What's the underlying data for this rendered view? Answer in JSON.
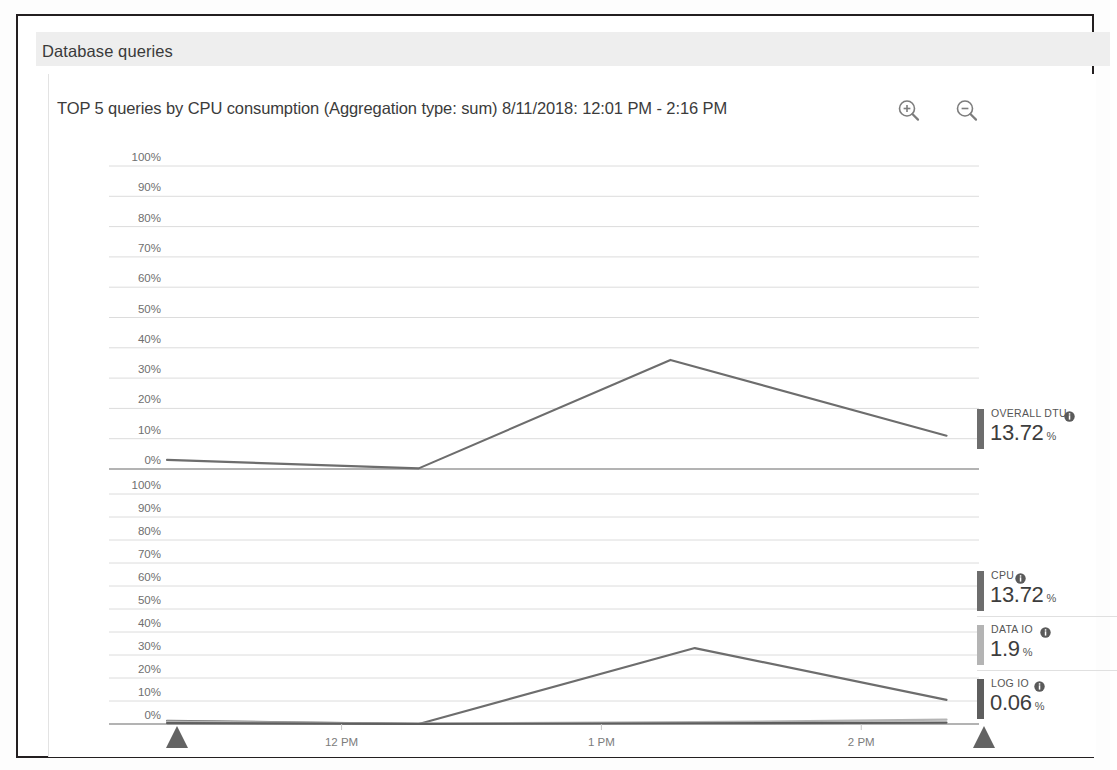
{
  "panel": {
    "header_title": "Database queries"
  },
  "chart": {
    "title": "TOP 5 queries by CPU consumption (Aggregation type: sum) 8/11/2018: 12:01 PM - 2:16 PM",
    "zoom_in_label": "zoom-in",
    "zoom_out_label": "zoom-out"
  },
  "legend": {
    "top": [
      {
        "label": "OVERALL DTU",
        "value": "13.72",
        "unit": "%",
        "color": "#6d6d6d"
      }
    ],
    "bottom": [
      {
        "label": "CPU",
        "value": "13.72",
        "unit": "%",
        "color": "#6d6d6d"
      },
      {
        "label": "DATA IO",
        "value": "1.9",
        "unit": "%",
        "color": "#b4b4b4"
      },
      {
        "label": "LOG IO",
        "value": "0.06",
        "unit": "%",
        "color": "#5e5e5e"
      }
    ]
  },
  "chart_data": {
    "type": "line",
    "title": "TOP 5 queries by CPU consumption (Aggregation type: sum) 8/11/2018: 12:01 PM - 2:16 PM",
    "xlabel": "",
    "ylabel": "",
    "grid": true,
    "legend_position": "right",
    "panels": [
      {
        "name": "Overall DTU",
        "ylim": [
          0,
          100
        ],
        "yticks": [
          "100%",
          "90%",
          "80%",
          "70%",
          "60%",
          "50%",
          "40%",
          "30%",
          "20%",
          "10%",
          "0%"
        ],
        "xticks": [
          "12 PM",
          "1 PM",
          "2 PM"
        ],
        "series": [
          {
            "name": "OVERALL DTU",
            "color": "#6d6d6d",
            "x": [
              0.0,
              0.31,
              0.62,
              0.96
            ],
            "values": [
              3.0,
              0.2,
              36.0,
              11.0
            ]
          }
        ]
      },
      {
        "name": "Resource consumption",
        "ylim": [
          0,
          100
        ],
        "yticks": [
          "100%",
          "90%",
          "80%",
          "70%",
          "60%",
          "50%",
          "40%",
          "30%",
          "20%",
          "10%",
          "0%"
        ],
        "xticks": [
          "12 PM",
          "1 PM",
          "2 PM"
        ],
        "series": [
          {
            "name": "CPU",
            "color": "#6d6d6d",
            "x": [
              0.0,
              0.31,
              0.65,
              0.96
            ],
            "values": [
              1.4,
              0.0,
              33.0,
              10.5
            ]
          },
          {
            "name": "DATA IO",
            "color": "#b4b4b4",
            "x": [
              0.0,
              0.31,
              0.65,
              0.96
            ],
            "values": [
              1.1,
              0.2,
              0.8,
              1.9
            ]
          },
          {
            "name": "LOG IO",
            "color": "#5e5e5e",
            "x": [
              0.0,
              0.31,
              0.65,
              0.96
            ],
            "values": [
              0.4,
              0.05,
              0.3,
              0.6
            ]
          }
        ]
      }
    ],
    "range_markers": [
      "start-handle",
      "end-handle"
    ]
  }
}
